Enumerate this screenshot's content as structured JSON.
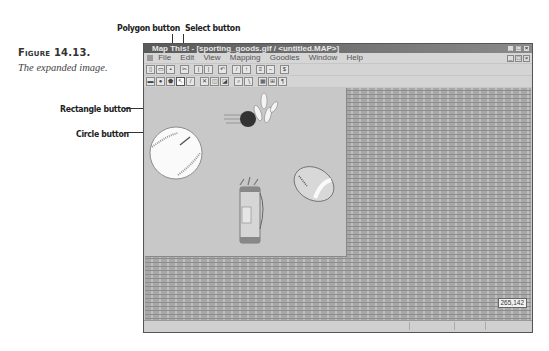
{
  "figure": {
    "title": "Figure 14.13.",
    "caption": "The expanded image."
  },
  "callouts": {
    "polygon": "Polygon button",
    "select": "Select button",
    "rectangle": "Rectangle button",
    "circle": "Circle button"
  },
  "window": {
    "title": "Map This! - [sporting_goods.gif / <untitled.MAP>]",
    "window_buttons": [
      "_",
      "□",
      "×"
    ],
    "menu": [
      "File",
      "Edit",
      "View",
      "Mapping",
      "Goodies",
      "Window",
      "Help"
    ],
    "toolbar1": [
      {
        "name": "new",
        "glyph": "▯"
      },
      {
        "name": "open",
        "glyph": "▭"
      },
      {
        "name": "save",
        "glyph": "▪"
      },
      {
        "name": "sep"
      },
      {
        "name": "cut",
        "glyph": "✂"
      },
      {
        "name": "sep"
      },
      {
        "name": "copy",
        "glyph": "|"
      },
      {
        "name": "paste",
        "glyph": "|"
      },
      {
        "name": "sep"
      },
      {
        "name": "undo",
        "glyph": "↶"
      },
      {
        "name": "sep"
      },
      {
        "name": "mark1",
        "glyph": "/"
      },
      {
        "name": "mark2",
        "glyph": "↑"
      },
      {
        "name": "sep"
      },
      {
        "name": "align1",
        "glyph": "≡"
      },
      {
        "name": "align2",
        "glyph": "−"
      },
      {
        "name": "sep"
      },
      {
        "name": "info",
        "glyph": "$"
      }
    ],
    "toolbar2": [
      {
        "name": "rectangle",
        "glyph": "▬"
      },
      {
        "name": "circle",
        "glyph": "●"
      },
      {
        "name": "polygon",
        "glyph": "⬟"
      },
      {
        "name": "select",
        "glyph": "↖",
        "active": true
      },
      {
        "name": "line",
        "glyph": "/"
      },
      {
        "name": "sep"
      },
      {
        "name": "delete",
        "glyph": "✕"
      },
      {
        "name": "front",
        "glyph": "◫"
      },
      {
        "name": "back",
        "glyph": "◪"
      },
      {
        "name": "sep"
      },
      {
        "name": "zoom-in",
        "glyph": "⌕"
      },
      {
        "name": "zoom-out",
        "glyph": "∖"
      },
      {
        "name": "sep"
      },
      {
        "name": "grid",
        "glyph": "▦"
      },
      {
        "name": "test",
        "glyph": "⊞"
      },
      {
        "name": "help",
        "glyph": "¶"
      }
    ],
    "status": {
      "coords": "265,142"
    },
    "image_objects": [
      "baseball",
      "bowling-ball-and-pins",
      "football",
      "golf-bag"
    ]
  }
}
